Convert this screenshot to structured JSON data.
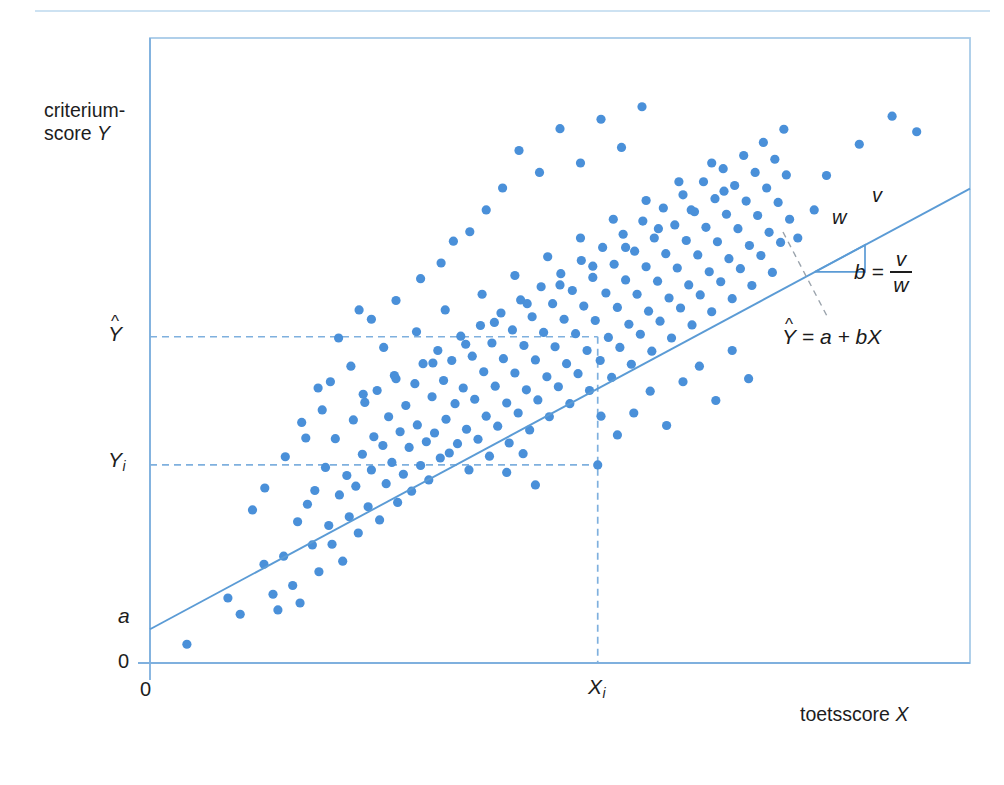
{
  "figure": {
    "kind": "statistics-textbook-figure",
    "language": "nl",
    "colors": {
      "point": "#4a90d9",
      "line": "#5b9bd5",
      "frame": "#a8cbe8",
      "dashed": "#7fb0de",
      "divider": "#bcd8ee",
      "text": "#1d1d1d"
    }
  },
  "axes": {
    "y_title_line1": "criterium-",
    "y_title_line2": "score ",
    "y_title_var": "Y",
    "x_title": "toetsscore ",
    "x_title_var": "X",
    "y_ticks": [
      {
        "name": "y-hat",
        "label": "Y",
        "hat": "^",
        "sub": "",
        "value_px": 337
      },
      {
        "name": "y-i",
        "label": "Y",
        "hat": "",
        "sub": "i",
        "value_px": 465
      },
      {
        "name": "intercept-a",
        "label": "a",
        "hat": "",
        "sub": "",
        "value_px": 618
      },
      {
        "name": "origin-y",
        "label": "0",
        "hat": "",
        "sub": "",
        "value_px": 663
      }
    ],
    "x_ticks": [
      {
        "name": "origin-x",
        "label": "0",
        "sub": "",
        "value_px": 150
      },
      {
        "name": "x-i",
        "label": "X",
        "sub": "i",
        "value_px": 598
      }
    ]
  },
  "annotations": {
    "slope_rise_label": "v",
    "slope_run_label": "w",
    "slope_formula_b": "b",
    "slope_formula_eq": "=",
    "slope_formula_numerator": "v",
    "slope_formula_denominator": "w",
    "regression_equation_hat": "^",
    "regression_equation_lhs": "Y",
    "regression_equation_rhs": " = a + bX"
  },
  "chart_data": {
    "type": "scatter",
    "title": "",
    "xlabel": "toetsscore X",
    "ylabel": "criterium-score Y",
    "grid": false,
    "legend": null,
    "xlim": [
      0,
      100
    ],
    "ylim": [
      0,
      100
    ],
    "regression_line": {
      "label": "Y-hat = a + bX",
      "intercept_a": 5.4,
      "slope_b": 0.705,
      "x_start": 0,
      "x_end": 100
    },
    "reference_lines": [
      {
        "name": "y-hat-line",
        "orientation": "horizontal",
        "value": 52.2,
        "style": "dashed",
        "from_x": 0,
        "to_x": 54.6
      },
      {
        "name": "y-i-line",
        "orientation": "horizontal",
        "value": 31.7,
        "style": "dashed",
        "from_x": 0,
        "to_x": 54.6
      },
      {
        "name": "x-i-line",
        "orientation": "vertical",
        "value": 54.6,
        "style": "dashed",
        "from_y": 0,
        "to_y": 52.2
      }
    ],
    "slope_triangle": {
      "x_left": 81.1,
      "x_right": 87.2,
      "y_bottom": 62.6,
      "y_top": 66.9
    },
    "n_points": 243,
    "points": [
      [
        4.5,
        3.0
      ],
      [
        9.5,
        10.4
      ],
      [
        11.0,
        7.8
      ],
      [
        13.9,
        15.8
      ],
      [
        15.0,
        11.0
      ],
      [
        15.6,
        8.5
      ],
      [
        16.3,
        17.1
      ],
      [
        17.4,
        12.4
      ],
      [
        18.0,
        22.6
      ],
      [
        18.3,
        9.6
      ],
      [
        19.2,
        25.4
      ],
      [
        19.8,
        18.9
      ],
      [
        20.1,
        27.6
      ],
      [
        20.6,
        14.6
      ],
      [
        21.4,
        31.3
      ],
      [
        21.8,
        22.0
      ],
      [
        22.2,
        19.0
      ],
      [
        22.6,
        35.9
      ],
      [
        23.1,
        26.9
      ],
      [
        23.5,
        16.3
      ],
      [
        24.0,
        30.0
      ],
      [
        24.3,
        23.4
      ],
      [
        24.8,
        38.9
      ],
      [
        25.1,
        28.3
      ],
      [
        25.4,
        20.8
      ],
      [
        25.9,
        33.4
      ],
      [
        26.2,
        41.7
      ],
      [
        26.6,
        25.0
      ],
      [
        27.0,
        30.9
      ],
      [
        27.3,
        36.2
      ],
      [
        27.7,
        43.6
      ],
      [
        28.0,
        22.9
      ],
      [
        28.4,
        34.8
      ],
      [
        28.8,
        28.7
      ],
      [
        29.1,
        39.4
      ],
      [
        29.5,
        32.1
      ],
      [
        29.8,
        46.0
      ],
      [
        30.2,
        25.7
      ],
      [
        30.5,
        37.0
      ],
      [
        30.9,
        30.2
      ],
      [
        31.2,
        41.2
      ],
      [
        31.6,
        34.5
      ],
      [
        31.9,
        27.5
      ],
      [
        32.3,
        44.7
      ],
      [
        32.6,
        38.1
      ],
      [
        33.0,
        31.6
      ],
      [
        33.3,
        47.9
      ],
      [
        33.7,
        35.4
      ],
      [
        34.0,
        29.3
      ],
      [
        34.4,
        42.6
      ],
      [
        34.7,
        36.8
      ],
      [
        35.1,
        50.0
      ],
      [
        35.4,
        32.8
      ],
      [
        35.8,
        45.2
      ],
      [
        36.1,
        39.0
      ],
      [
        36.5,
        33.6
      ],
      [
        36.8,
        48.4
      ],
      [
        37.2,
        41.5
      ],
      [
        37.5,
        35.1
      ],
      [
        37.9,
        52.3
      ],
      [
        38.2,
        44.0
      ],
      [
        38.6,
        37.4
      ],
      [
        38.9,
        30.9
      ],
      [
        39.3,
        49.1
      ],
      [
        39.6,
        42.2
      ],
      [
        40.0,
        35.8
      ],
      [
        40.3,
        54.0
      ],
      [
        40.7,
        46.6
      ],
      [
        41.0,
        39.5
      ],
      [
        41.4,
        33.1
      ],
      [
        41.7,
        51.2
      ],
      [
        42.1,
        44.3
      ],
      [
        42.4,
        37.9
      ],
      [
        42.8,
        56.0
      ],
      [
        43.1,
        48.7
      ],
      [
        43.5,
        41.6
      ],
      [
        43.8,
        35.2
      ],
      [
        44.2,
        53.3
      ],
      [
        44.5,
        46.4
      ],
      [
        44.9,
        40.0
      ],
      [
        45.2,
        58.1
      ],
      [
        45.6,
        50.8
      ],
      [
        45.9,
        43.7
      ],
      [
        46.3,
        37.3
      ],
      [
        46.6,
        55.4
      ],
      [
        47.0,
        48.5
      ],
      [
        47.3,
        42.1
      ],
      [
        47.7,
        60.2
      ],
      [
        48.0,
        52.9
      ],
      [
        48.4,
        45.8
      ],
      [
        48.7,
        39.4
      ],
      [
        49.1,
        57.5
      ],
      [
        49.4,
        50.6
      ],
      [
        49.8,
        44.2
      ],
      [
        50.1,
        62.3
      ],
      [
        50.5,
        55.0
      ],
      [
        50.8,
        47.9
      ],
      [
        51.2,
        41.5
      ],
      [
        51.5,
        59.6
      ],
      [
        51.9,
        52.7
      ],
      [
        52.2,
        46.3
      ],
      [
        52.6,
        64.4
      ],
      [
        52.9,
        57.1
      ],
      [
        53.3,
        50.0
      ],
      [
        53.6,
        43.6
      ],
      [
        54.0,
        61.7
      ],
      [
        54.3,
        54.8
      ],
      [
        54.6,
        31.7
      ],
      [
        54.9,
        48.4
      ],
      [
        55.2,
        66.5
      ],
      [
        55.6,
        59.2
      ],
      [
        55.9,
        52.1
      ],
      [
        56.3,
        45.7
      ],
      [
        56.6,
        63.8
      ],
      [
        57.0,
        56.9
      ],
      [
        57.3,
        50.5
      ],
      [
        57.7,
        68.6
      ],
      [
        58.0,
        61.3
      ],
      [
        58.4,
        54.2
      ],
      [
        58.7,
        47.8
      ],
      [
        59.1,
        65.9
      ],
      [
        59.4,
        59.0
      ],
      [
        59.8,
        52.6
      ],
      [
        60.1,
        70.7
      ],
      [
        60.5,
        63.4
      ],
      [
        60.8,
        56.3
      ],
      [
        61.2,
        49.9
      ],
      [
        61.5,
        68.0
      ],
      [
        61.9,
        61.1
      ],
      [
        62.2,
        54.7
      ],
      [
        62.6,
        72.8
      ],
      [
        62.9,
        65.5
      ],
      [
        63.3,
        58.4
      ],
      [
        63.6,
        52.0
      ],
      [
        64.0,
        70.1
      ],
      [
        64.3,
        63.2
      ],
      [
        64.7,
        56.8
      ],
      [
        65.0,
        74.9
      ],
      [
        65.4,
        67.6
      ],
      [
        65.7,
        60.5
      ],
      [
        66.1,
        54.1
      ],
      [
        66.4,
        72.2
      ],
      [
        66.8,
        65.3
      ],
      [
        67.1,
        58.9
      ],
      [
        67.5,
        77.0
      ],
      [
        67.8,
        69.7
      ],
      [
        68.2,
        62.6
      ],
      [
        68.5,
        56.2
      ],
      [
        68.9,
        74.3
      ],
      [
        69.2,
        67.4
      ],
      [
        69.6,
        61.0
      ],
      [
        69.9,
        79.1
      ],
      [
        70.3,
        71.8
      ],
      [
        70.6,
        64.7
      ],
      [
        71.0,
        58.3
      ],
      [
        71.3,
        76.4
      ],
      [
        71.7,
        69.5
      ],
      [
        72.0,
        63.1
      ],
      [
        72.4,
        81.2
      ],
      [
        72.7,
        73.9
      ],
      [
        73.1,
        66.8
      ],
      [
        73.4,
        60.4
      ],
      [
        73.8,
        78.5
      ],
      [
        74.1,
        71.6
      ],
      [
        74.5,
        65.2
      ],
      [
        74.8,
        83.3
      ],
      [
        75.2,
        76.0
      ],
      [
        75.5,
        68.9
      ],
      [
        75.9,
        62.5
      ],
      [
        76.2,
        80.6
      ],
      [
        76.6,
        73.7
      ],
      [
        76.9,
        67.3
      ],
      [
        77.3,
        85.4
      ],
      [
        77.6,
        78.1
      ],
      [
        78.0,
        71.0
      ],
      [
        22.0,
        45.0
      ],
      [
        24.5,
        47.5
      ],
      [
        26.0,
        43.0
      ],
      [
        28.5,
        50.5
      ],
      [
        30.0,
        45.5
      ],
      [
        32.5,
        53.0
      ],
      [
        34.5,
        48.0
      ],
      [
        36.0,
        56.5
      ],
      [
        38.5,
        51.0
      ],
      [
        40.5,
        59.0
      ],
      [
        42.0,
        54.5
      ],
      [
        44.5,
        62.0
      ],
      [
        46.0,
        57.5
      ],
      [
        48.5,
        65.0
      ],
      [
        50.0,
        60.5
      ],
      [
        52.5,
        68.0
      ],
      [
        54.0,
        63.5
      ],
      [
        56.5,
        71.0
      ],
      [
        58.0,
        66.5
      ],
      [
        60.5,
        74.0
      ],
      [
        62.0,
        69.5
      ],
      [
        64.5,
        77.0
      ],
      [
        66.0,
        72.5
      ],
      [
        68.5,
        80.0
      ],
      [
        70.0,
        75.5
      ],
      [
        45.0,
        82.0
      ],
      [
        47.5,
        78.5
      ],
      [
        50.0,
        85.5
      ],
      [
        52.5,
        80.0
      ],
      [
        55.0,
        87.0
      ],
      [
        57.5,
        82.5
      ],
      [
        60.0,
        89.0
      ],
      [
        43.0,
        76.0
      ],
      [
        41.0,
        72.5
      ],
      [
        39.0,
        69.0
      ],
      [
        59.0,
        40.0
      ],
      [
        61.0,
        43.5
      ],
      [
        63.0,
        38.0
      ],
      [
        65.0,
        45.0
      ],
      [
        57.0,
        36.5
      ],
      [
        55.0,
        39.5
      ],
      [
        67.0,
        47.5
      ],
      [
        69.0,
        42.0
      ],
      [
        71.0,
        50.0
      ],
      [
        73.0,
        45.5
      ],
      [
        86.5,
        83.0
      ],
      [
        90.5,
        87.5
      ],
      [
        93.5,
        85.0
      ],
      [
        81.0,
        72.5
      ],
      [
        79.0,
        68.0
      ],
      [
        82.5,
        78.0
      ],
      [
        30.0,
        58.0
      ],
      [
        33.0,
        61.5
      ],
      [
        27.0,
        55.0
      ],
      [
        35.5,
        64.0
      ],
      [
        23.0,
        52.0
      ],
      [
        25.5,
        56.5
      ],
      [
        37.0,
        67.5
      ],
      [
        20.5,
        44.0
      ],
      [
        18.5,
        38.5
      ],
      [
        16.5,
        33.0
      ],
      [
        14.0,
        28.0
      ],
      [
        12.5,
        24.5
      ],
      [
        21.0,
        40.5
      ],
      [
        19.0,
        36.0
      ],
      [
        43.5,
        30.5
      ],
      [
        45.5,
        33.5
      ],
      [
        47.0,
        28.5
      ]
    ]
  }
}
